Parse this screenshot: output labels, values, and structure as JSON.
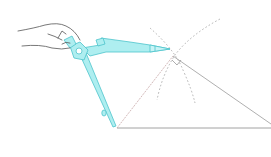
{
  "figure": {
    "caption": "Compass construction: drawing intersecting arcs above a triangle base",
    "colors": {
      "compass_fill": "#aeeef0",
      "compass_stroke": "#4cc4cc",
      "line": "#9a9a9a",
      "dotted": "#a8a8a8",
      "hand": "#555555",
      "background": "#ffffff"
    },
    "elements": [
      {
        "name": "hand",
        "label": "hand holding compass"
      },
      {
        "name": "compass",
        "label": "compass"
      },
      {
        "name": "triangle",
        "label": "triangle"
      },
      {
        "name": "arc-left",
        "label": "construction arc"
      },
      {
        "name": "arc-right",
        "label": "construction arc"
      },
      {
        "name": "right-angle-marker",
        "label": "right angle marker"
      }
    ]
  }
}
